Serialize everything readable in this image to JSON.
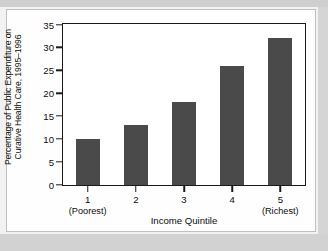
{
  "figure": {
    "bar_color": "#4a4a4a",
    "frame_color": "#1a1a1a",
    "page_background": "#d2d2d2",
    "card_background": "#fefefe"
  },
  "chart_data": {
    "type": "bar",
    "title": "",
    "xlabel": "Income Quintile",
    "ylabel_line1": "Percentage of Public Expenditure on",
    "ylabel_line2": "Curative Health Care, 1995–1996",
    "categories": [
      "1",
      "2",
      "3",
      "4",
      "5"
    ],
    "category_sublabels": [
      "(Poorest)",
      "",
      "",
      "",
      "(Richest)"
    ],
    "values": [
      10,
      13,
      18,
      26,
      32
    ],
    "ylim": [
      0,
      35
    ],
    "yticks": [
      0,
      5,
      10,
      15,
      20,
      25,
      30,
      35
    ],
    "ytick_labels": [
      "0",
      "5",
      "10",
      "15",
      "20",
      "25",
      "30",
      "35"
    ],
    "grid": false,
    "legend": false
  }
}
